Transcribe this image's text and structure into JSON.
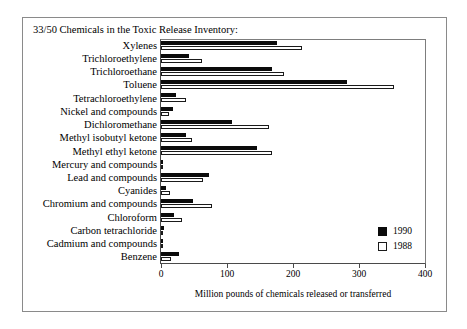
{
  "figure": {
    "title": "33/50 Chemicals in the Toxic Release Inventory:",
    "xlabel": "Million pounds of chemicals released or transferred"
  },
  "legend": {
    "position": "inside-right",
    "entries": [
      {
        "label": "1990",
        "swatch": "filled-black-square",
        "color": "#0b0b0b"
      },
      {
        "label": "1988",
        "swatch": "open-white-square",
        "color": "#ffffff"
      }
    ]
  },
  "chart_data": {
    "type": "bar",
    "orientation": "horizontal",
    "title": "33/50 Chemicals in the Toxic Release Inventory:",
    "xlabel": "Million pounds of chemicals released or transferred",
    "ylabel": "",
    "xlim": [
      0,
      400
    ],
    "xticks": [
      0,
      100,
      200,
      300,
      400
    ],
    "grid": false,
    "categories": [
      "Xylenes",
      "Trichloroethylene",
      "Trichloroethane",
      "Toluene",
      "Tetrachloroethylene",
      "Nickel and compounds",
      "Dichloromethane",
      "Methyl isobutyl ketone",
      "Methyl ethyl ketone",
      "Mercury and compounds",
      "Lead and compounds",
      "Cyanides",
      "Chromium and compounds",
      "Chloroform",
      "Carbon tetrachloride",
      "Cadmium and compounds",
      "Benzene"
    ],
    "series": [
      {
        "name": "1990",
        "color": "#0b0b0b",
        "values": [
          176,
          43,
          168,
          282,
          22,
          18,
          107,
          38,
          145,
          3,
          73,
          7,
          48,
          20,
          4,
          2,
          27
        ]
      },
      {
        "name": "1988",
        "color": "#ffffff",
        "values": [
          214,
          62,
          187,
          353,
          38,
          12,
          163,
          47,
          168,
          3,
          63,
          13,
          77,
          32,
          2,
          2,
          15
        ]
      }
    ]
  }
}
